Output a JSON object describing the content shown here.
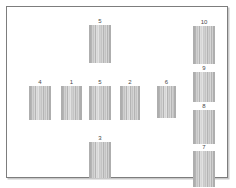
{
  "figure": {
    "title": "",
    "panel_border_color": "#7d7d7d",
    "background_color": "#ffffff",
    "lane_fill_color": "#c2c2c2",
    "lane_edge_color": "#aeaeae",
    "label_color": "#4a4a4a"
  },
  "chart_data": {
    "type": "table",
    "title": "",
    "subtitle": "",
    "xlabel": "",
    "ylabel": "",
    "grid": false,
    "legend": null,
    "categories": [
      "5",
      "4",
      "1",
      "5",
      "2",
      "6",
      "3",
      "10",
      "9",
      "8",
      "7"
    ],
    "values": [
      48,
      40,
      40,
      40,
      40,
      40,
      42,
      45,
      36,
      40,
      43
    ],
    "groups": [
      {
        "name": "top-center",
        "lanes": [
          "5"
        ]
      },
      {
        "name": "middle-row",
        "lanes": [
          "4",
          "1",
          "5",
          "2",
          "6"
        ]
      },
      {
        "name": "bottom-center",
        "lanes": [
          "3"
        ]
      },
      {
        "name": "right-column",
        "lanes": [
          "10",
          "9",
          "8",
          "7"
        ]
      }
    ]
  },
  "lanes": [
    {
      "id": "lane-top-5",
      "label": "5",
      "group": "top-center",
      "x": 82,
      "y": 18,
      "w": 22,
      "h": 38
    },
    {
      "id": "lane-mid-4",
      "label": "4",
      "group": "middle-row",
      "x": 22,
      "y": 79,
      "w": 22,
      "h": 34
    },
    {
      "id": "lane-mid-1",
      "label": "1",
      "group": "middle-row",
      "x": 54,
      "y": 79,
      "w": 21,
      "h": 34
    },
    {
      "id": "lane-mid-5",
      "label": "5",
      "group": "middle-row",
      "x": 82,
      "y": 79,
      "w": 22,
      "h": 34
    },
    {
      "id": "lane-mid-2",
      "label": "2",
      "group": "middle-row",
      "x": 113,
      "y": 79,
      "w": 20,
      "h": 34
    },
    {
      "id": "lane-mid-6",
      "label": "6",
      "group": "middle-row",
      "x": 150,
      "y": 79,
      "w": 19,
      "h": 32
    },
    {
      "id": "lane-bot-3",
      "label": "3",
      "group": "bottom-center",
      "x": 82,
      "y": 135,
      "w": 22,
      "h": 36
    },
    {
      "id": "lane-right-10",
      "label": "10",
      "group": "right-column",
      "x": 186,
      "y": 19,
      "w": 22,
      "h": 38
    },
    {
      "id": "lane-right-9",
      "label": "9",
      "group": "right-column",
      "x": 186,
      "y": 65,
      "w": 22,
      "h": 30
    },
    {
      "id": "lane-right-8",
      "label": "8",
      "group": "right-column",
      "x": 186,
      "y": 103,
      "w": 22,
      "h": 34
    },
    {
      "id": "lane-right-7",
      "label": "7",
      "group": "right-column",
      "x": 186,
      "y": 144,
      "w": 22,
      "h": 36
    }
  ]
}
